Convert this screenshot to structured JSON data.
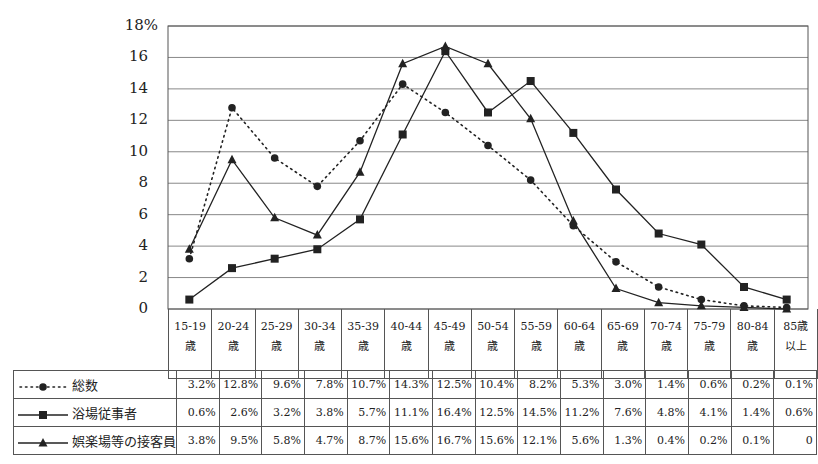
{
  "chart_data": {
    "type": "line",
    "title": "",
    "xlabel": "",
    "ylabel": "",
    "ylim": [
      0,
      18
    ],
    "y_ticks": [
      "18%",
      "16",
      "14",
      "12",
      "10",
      "8",
      "6",
      "4",
      "2",
      "0"
    ],
    "grid": true,
    "categories": [
      "15-19歳",
      "20-24歳",
      "25-29歳",
      "30-34歳",
      "35-39歳",
      "40-44歳",
      "45-49歳",
      "50-54歳",
      "55-59歳",
      "60-64歳",
      "65-69歳",
      "70-74歳",
      "75-79歳",
      "80-84歳",
      "85歳以上"
    ],
    "category_labels": [
      {
        "top": "15-19",
        "bottom": "歳"
      },
      {
        "top": "20-24",
        "bottom": "歳"
      },
      {
        "top": "25-29",
        "bottom": "歳"
      },
      {
        "top": "30-34",
        "bottom": "歳"
      },
      {
        "top": "35-39",
        "bottom": "歳"
      },
      {
        "top": "40-44",
        "bottom": "歳"
      },
      {
        "top": "45-49",
        "bottom": "歳"
      },
      {
        "top": "50-54",
        "bottom": "歳"
      },
      {
        "top": "55-59",
        "bottom": "歳"
      },
      {
        "top": "60-64",
        "bottom": "歳"
      },
      {
        "top": "65-69",
        "bottom": "歳"
      },
      {
        "top": "70-74",
        "bottom": "歳"
      },
      {
        "top": "75-79",
        "bottom": "歳"
      },
      {
        "top": "80-84",
        "bottom": "歳"
      },
      {
        "top": "85歳",
        "bottom": "以上"
      }
    ],
    "series": [
      {
        "name": "総数",
        "marker": "circle",
        "line": "dotted",
        "values": [
          3.2,
          12.8,
          9.6,
          7.8,
          10.7,
          14.3,
          12.5,
          10.4,
          8.2,
          5.3,
          3.0,
          1.4,
          0.6,
          0.2,
          0.1
        ],
        "labels": [
          "3.2%",
          "12.8%",
          "9.6%",
          "7.8%",
          "10.7%",
          "14.3%",
          "12.5%",
          "10.4%",
          "8.2%",
          "5.3%",
          "3.0%",
          "1.4%",
          "0.6%",
          "0.2%",
          "0.1%"
        ]
      },
      {
        "name": "浴場従事者",
        "marker": "square",
        "line": "solid",
        "values": [
          0.6,
          2.6,
          3.2,
          3.8,
          5.7,
          11.1,
          16.4,
          12.5,
          14.5,
          11.2,
          7.6,
          4.8,
          4.1,
          1.4,
          0.6
        ],
        "labels": [
          "0.6%",
          "2.6%",
          "3.2%",
          "3.8%",
          "5.7%",
          "11.1%",
          "16.4%",
          "12.5%",
          "14.5%",
          "11.2%",
          "7.6%",
          "4.8%",
          "4.1%",
          "1.4%",
          "0.6%"
        ]
      },
      {
        "name": "娯楽場等の接客員",
        "marker": "triangle",
        "line": "solid",
        "values": [
          3.8,
          9.5,
          5.8,
          4.7,
          8.7,
          15.6,
          16.7,
          15.6,
          12.1,
          5.6,
          1.3,
          0.4,
          0.2,
          0.1,
          0
        ],
        "labels": [
          "3.8%",
          "9.5%",
          "5.8%",
          "4.7%",
          "8.7%",
          "15.6%",
          "16.7%",
          "15.6%",
          "12.1%",
          "5.6%",
          "1.3%",
          "0.4%",
          "0.2%",
          "0.1%",
          "0"
        ]
      }
    ],
    "legend_position": "data-table-left"
  },
  "colors": {
    "line": "#222222",
    "grid": "#888888",
    "border": "#555555"
  }
}
